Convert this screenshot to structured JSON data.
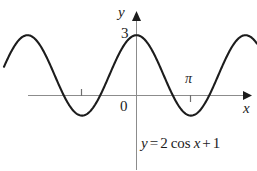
{
  "figure": {
    "name": "cosine-graph",
    "background_color": "#ffffff",
    "ink_color": "#1c1c1c",
    "axis_color": "#808080"
  },
  "labels": {
    "y_axis": "y",
    "x_axis": "x",
    "origin": "0",
    "y_tick_three": "3",
    "x_tick_pi": "π",
    "equation_full": "y = 2 cos x + 1",
    "equation_parts": {
      "lhs": "y",
      "equals": "=",
      "coefficient": "2",
      "function": "cos",
      "variable": "x",
      "plus": "+",
      "constant": "1"
    }
  },
  "chart_data": {
    "type": "line",
    "title": "",
    "subtitle": "",
    "xlabel": "x",
    "ylabel": "y",
    "equation": "y = 2 cos x + 1",
    "amplitude": 2,
    "vertical_shift": 1,
    "period": 6.2832,
    "maximum": 3,
    "minimum": -1,
    "grid": false,
    "legend": false,
    "xlim": [
      -7.6,
      7.6
    ],
    "ylim": [
      -1.6,
      3.6
    ],
    "x_ticks": [
      {
        "value": 3.1416,
        "label": "π"
      },
      {
        "value": -3.1416,
        "label": ""
      }
    ],
    "y_ticks": [
      {
        "value": 3,
        "label": "3"
      },
      {
        "value": 0,
        "label": "0"
      }
    ],
    "annotations": [
      "y = 2 cos x + 1"
    ],
    "key_points": [
      {
        "x": -6.2832,
        "y": 3,
        "note": "maximum"
      },
      {
        "x": -3.1416,
        "y": -1,
        "note": "minimum"
      },
      {
        "x": -2.0944,
        "y": 0,
        "note": "x-intercept"
      },
      {
        "x": 0,
        "y": 3,
        "note": "maximum"
      },
      {
        "x": 2.0944,
        "y": 0,
        "note": "x-intercept"
      },
      {
        "x": 3.1416,
        "y": -1,
        "note": "minimum"
      },
      {
        "x": 6.2832,
        "y": 3,
        "note": "maximum"
      }
    ],
    "series": [
      {
        "name": "y = 2 cos x + 1",
        "x": [
          -7.6,
          -7.2,
          -6.8,
          -6.4,
          -6.0,
          -5.6,
          -5.2,
          -4.8,
          -4.4,
          -4.0,
          -3.6,
          -3.2,
          -2.8,
          -2.4,
          -2.0,
          -1.6,
          -1.2,
          -0.8,
          -0.4,
          0.0,
          0.4,
          0.8,
          1.2,
          1.6,
          2.0,
          2.4,
          2.8,
          3.2,
          3.6,
          4.0,
          4.4,
          4.8,
          5.2,
          5.6,
          6.0,
          6.4,
          6.8,
          7.2,
          7.6
        ],
        "y": [
          1.54,
          2.21,
          2.72,
          2.98,
          2.92,
          2.57,
          1.98,
          1.18,
          0.37,
          -0.31,
          -0.79,
          -1.0,
          -0.88,
          -0.47,
          0.17,
          0.94,
          1.72,
          2.39,
          2.84,
          3.0,
          2.84,
          2.39,
          1.72,
          0.94,
          0.17,
          -0.47,
          -0.88,
          -1.0,
          -0.79,
          -0.31,
          0.37,
          1.18,
          1.98,
          2.57,
          2.92,
          2.98,
          2.72,
          2.21,
          1.54
        ]
      }
    ]
  }
}
